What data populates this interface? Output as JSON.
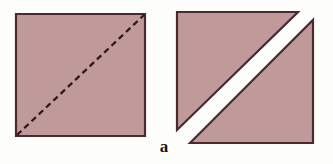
{
  "figure": {
    "caption": "a",
    "background_color": "#fdfdfc",
    "fill_color": "#c09a9a",
    "stroke_color": "#4a2a2e",
    "gap_color": "#ffffff",
    "caption_color": "#1c1514",
    "stroke_width": 2.2,
    "dash_pattern": "6 4",
    "left_shape": {
      "name": "square-with-dashed-diagonal",
      "description": "Filled square with a dashed diagonal line from bottom-left corner to top-right corner",
      "square_points": "16,14 145,14 145,136 16,136",
      "diagonal_start_x": 17,
      "diagonal_start_y": 135,
      "diagonal_end_x": 144,
      "diagonal_end_y": 15
    },
    "right_shape": {
      "name": "square-cut-into-two-triangles",
      "description": "Same square cut along the diagonal into two triangles separated by a white diagonal gap",
      "upper_left_triangle_points": "177,12 298,12 177,130",
      "lower_right_triangle_points": "190,143 313,20 313,143"
    }
  }
}
